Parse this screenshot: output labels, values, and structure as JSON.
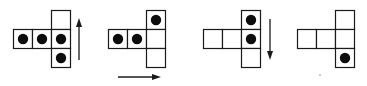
{
  "cell_layout": {
    "row_cells": [
      "left",
      "middle",
      "junction"
    ],
    "column_cells": [
      "top",
      "junction",
      "bottom"
    ]
  },
  "panels": [
    {
      "id": 1,
      "balls": [
        "left",
        "middle",
        "junction",
        "bottom"
      ],
      "arrow": {
        "direction": "up",
        "position": "right"
      }
    },
    {
      "id": 2,
      "balls": [
        "left",
        "middle",
        "top"
      ],
      "arrow": {
        "direction": "right",
        "position": "below"
      }
    },
    {
      "id": 3,
      "balls": [
        "top",
        "junction"
      ],
      "arrow": {
        "direction": "down",
        "position": "right"
      }
    },
    {
      "id": 4,
      "balls": [
        "bottom"
      ],
      "arrow": null
    }
  ],
  "colors": {
    "stroke": "#1a1a1a",
    "ball": "#0d0d0d",
    "background": "#ffffff"
  }
}
